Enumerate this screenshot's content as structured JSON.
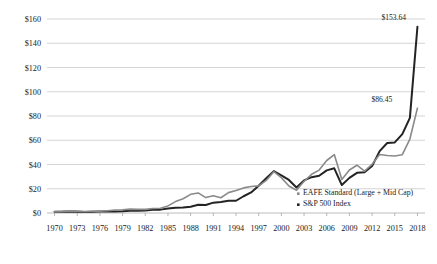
{
  "chart_data": {
    "type": "line",
    "title": "",
    "subtitle": "",
    "xlabel": "",
    "ylabel": "",
    "xlim": [
      1969,
      2019
    ],
    "ylim": [
      0,
      160
    ],
    "grid": true,
    "legend_position": "inside-bottom-right",
    "y_ticks": [
      "$0",
      "$20",
      "$40",
      "$60",
      "$80",
      "$100",
      "$120",
      "$140",
      "$160"
    ],
    "y_tick_values": [
      0,
      20,
      40,
      60,
      80,
      100,
      120,
      140,
      160
    ],
    "x_ticks": [
      "1970",
      "1973",
      "1976",
      "1979",
      "1982",
      "1985",
      "1988",
      "1991",
      "1994",
      "1997",
      "2000",
      "2003",
      "2006",
      "2009",
      "2012",
      "2015",
      "2018"
    ],
    "x_tick_values": [
      1970,
      1973,
      1976,
      1979,
      1982,
      1985,
      1988,
      1991,
      1994,
      1997,
      2000,
      2003,
      2006,
      2009,
      2012,
      2015,
      2018
    ],
    "x": [
      1970,
      1971,
      1972,
      1973,
      1974,
      1975,
      1976,
      1977,
      1978,
      1979,
      1980,
      1981,
      1982,
      1983,
      1984,
      1985,
      1986,
      1987,
      1988,
      1989,
      1990,
      1991,
      1992,
      1993,
      1994,
      1995,
      1996,
      1997,
      1998,
      1999,
      2000,
      2001,
      2002,
      2003,
      2004,
      2005,
      2006,
      2007,
      2008,
      2009,
      2010,
      2011,
      2012,
      2013,
      2014,
      2015,
      2016,
      2017,
      2018
    ],
    "series": [
      {
        "name": "S&P 500 Index",
        "color": "#232323",
        "width": 2.0,
        "end_label": "$153.64",
        "end_value": 153.64,
        "values": [
          1.0,
          1.04,
          1.22,
          1.04,
          0.76,
          1.04,
          1.27,
          1.16,
          1.22,
          1.44,
          1.89,
          1.79,
          2.16,
          2.63,
          2.78,
          3.64,
          4.29,
          4.49,
          5.22,
          6.83,
          6.59,
          8.55,
          9.14,
          10.02,
          10.1,
          13.82,
          16.93,
          22.46,
          28.72,
          34.52,
          31.11,
          27.24,
          21.05,
          26.87,
          29.53,
          30.73,
          35.17,
          36.85,
          23.06,
          28.96,
          33.1,
          33.6,
          38.7,
          51.02,
          57.7,
          58.2,
          65.0,
          78.5,
          153.64
        ]
      },
      {
        "name": "EAFE Standard (Large + Mid Cap)",
        "color": "#8a8a8a",
        "width": 1.6,
        "end_label": "$86.45",
        "end_value": 86.45,
        "values": [
          1.0,
          1.3,
          1.77,
          1.52,
          1.1,
          1.49,
          1.56,
          1.86,
          2.5,
          2.62,
          3.21,
          3.0,
          2.97,
          3.69,
          3.95,
          5.85,
          9.39,
          11.7,
          15.4,
          16.55,
          12.7,
          14.3,
          12.6,
          16.8,
          18.6,
          20.7,
          21.9,
          22.4,
          26.85,
          34.1,
          29.2,
          22.3,
          18.8,
          26.1,
          31.9,
          35.4,
          43.3,
          48.2,
          27.6,
          35.5,
          39.4,
          34.6,
          40.2,
          48.2,
          47.4,
          47.0,
          48.1,
          61.0,
          86.45
        ]
      }
    ],
    "annotations": [
      {
        "text": "$153.64",
        "series": "S&P 500 Index"
      },
      {
        "text": "$86.45",
        "series": "EAFE Standard (Large + Mid Cap)"
      }
    ],
    "legend": [
      {
        "label": "EAFE Standard (Large + Mid Cap)",
        "color": "#8a8a8a"
      },
      {
        "label": "S&P 500 Index",
        "color": "#232323"
      }
    ]
  }
}
